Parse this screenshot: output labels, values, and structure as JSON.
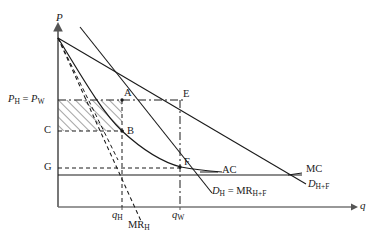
{
  "figure": {
    "type": "economics-diagram",
    "axes": {
      "y_label": "P",
      "x_label": "q",
      "y_axis_x": 58,
      "x_axis_y": 207
    },
    "price_ticks": [
      {
        "key": "pw",
        "label_html": "P<sub>H</sub> = P<sub>W</sub>",
        "y": 100
      },
      {
        "key": "c",
        "label_html": "C",
        "y": 131
      },
      {
        "key": "g",
        "label_html": "G",
        "y": 168
      }
    ],
    "quantity_ticks": [
      {
        "key": "qh",
        "label_html": "q<sub>H</sub>",
        "x": 120
      },
      {
        "key": "qw",
        "label_html": "q<sub>W</sub>",
        "x": 180
      }
    ],
    "points": [
      {
        "name": "A",
        "label": "A",
        "x": 122,
        "y": 100
      },
      {
        "name": "B",
        "label": "B",
        "x": 122,
        "y": 131
      },
      {
        "name": "E",
        "label": "E",
        "x": 180,
        "y": 100
      },
      {
        "name": "F",
        "label": "F",
        "x": 180,
        "y": 167
      }
    ],
    "curve_labels": [
      {
        "key": "ac",
        "label_html": "AC",
        "x": 222,
        "y": 171
      },
      {
        "key": "mc",
        "label_html": "MC",
        "x": 306,
        "y": 170
      },
      {
        "key": "dhf",
        "label_html": "D<sub>H+F</sub>",
        "x": 312,
        "y": 186
      },
      {
        "key": "dh_mrhf",
        "label_html": "D<sub>H</sub> = MR<sub>H+F</sub>",
        "x": 212,
        "y": 193
      },
      {
        "key": "mrh",
        "label_html": "MR<sub>H</sub>",
        "x": 130,
        "y": 224
      }
    ],
    "shaded_region": {
      "name": "profit-rectangle",
      "x": 58,
      "y": 100,
      "width": 64,
      "height": 31,
      "hatch": "diagonal"
    },
    "colors": {
      "line": "#1a1a1a",
      "axis": "#555555",
      "hatch": "#4a4a4a",
      "text": "#1a1a1a"
    }
  }
}
